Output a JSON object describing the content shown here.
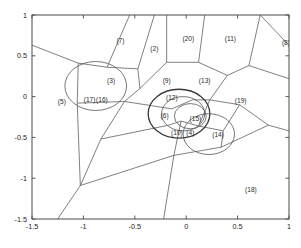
{
  "chart_data": {
    "type": "scatter",
    "title": "",
    "subtitle": "",
    "xlabel": "",
    "ylabel": "",
    "xlim": [
      -1.5,
      1.0
    ],
    "ylim": [
      -1.5,
      1.0
    ],
    "grid": false,
    "legend": "none",
    "xticks": [
      "-1.5",
      "-1",
      "-0.5",
      "0",
      "0.5",
      "1"
    ],
    "xtick_values": [
      -1.5,
      -1,
      -0.5,
      0,
      0.5,
      1
    ],
    "yticks": [
      "1",
      "0.5",
      "0",
      "-0.5",
      "-1",
      "-1.5"
    ],
    "ytick_values": [
      1,
      0.5,
      0,
      -0.5,
      -1,
      -1.5
    ],
    "annotations": [
      {
        "label": "(7)",
        "x": -0.64,
        "y": 0.66
      },
      {
        "label": "(2)",
        "x": -0.31,
        "y": 0.56
      },
      {
        "label": "(20)",
        "x": 0.02,
        "y": 0.68
      },
      {
        "label": "(11)",
        "x": 0.43,
        "y": 0.68
      },
      {
        "label": "(8)",
        "x": 0.97,
        "y": 0.63
      },
      {
        "label": "(3)",
        "x": -0.73,
        "y": 0.17
      },
      {
        "label": "(9)",
        "x": -0.19,
        "y": 0.17
      },
      {
        "label": "(13)",
        "x": 0.18,
        "y": 0.17
      },
      {
        "label": "(5)",
        "x": -1.21,
        "y": -0.09
      },
      {
        "label": "(17)",
        "x": -0.94,
        "y": -0.07
      },
      {
        "label": "(16)",
        "x": -0.82,
        "y": -0.07
      },
      {
        "label": "(12)",
        "x": -0.14,
        "y": -0.04
      },
      {
        "label": "(19)",
        "x": 0.53,
        "y": -0.08
      },
      {
        "label": "(6)",
        "x": -0.21,
        "y": -0.26
      },
      {
        "label": "(15)",
        "x": 0.09,
        "y": -0.3
      },
      {
        "label": "(10)",
        "x": -0.09,
        "y": -0.47
      },
      {
        "label": "(4)",
        "x": 0.04,
        "y": -0.47
      },
      {
        "label": "(14)",
        "x": 0.31,
        "y": -0.5
      },
      {
        "label": "(18)",
        "x": 0.63,
        "y": -1.17
      }
    ],
    "circles": [
      {
        "cx": -0.88,
        "cy": 0.13,
        "r": 0.3,
        "emphasis": "normal"
      },
      {
        "cx": -0.07,
        "cy": -0.21,
        "r": 0.3,
        "emphasis": "bold"
      },
      {
        "cx": -0.03,
        "cy": -0.21,
        "r": 0.21,
        "emphasis": "normal"
      },
      {
        "cx": 0.04,
        "cy": -0.24,
        "r": 0.155,
        "emphasis": "normal"
      },
      {
        "cx": 0.22,
        "cy": -0.46,
        "r": 0.25,
        "emphasis": "normal"
      }
    ],
    "voronoi_edges": [
      [
        [
          -1.5,
          0.63
        ],
        [
          -1.05,
          0.41
        ]
      ],
      [
        [
          -1.05,
          0.41
        ],
        [
          -0.77,
          0.36
        ]
      ],
      [
        [
          -0.77,
          0.36
        ],
        [
          -0.47,
          0.34
        ]
      ],
      [
        [
          -0.47,
          0.34
        ],
        [
          -0.45,
          0.1
        ]
      ],
      [
        [
          -0.45,
          0.1
        ],
        [
          -0.6,
          -0.06
        ]
      ],
      [
        [
          -0.6,
          -0.06
        ],
        [
          -1.06,
          -0.08
        ]
      ],
      [
        [
          -1.06,
          -0.08
        ],
        [
          -1.05,
          0.41
        ]
      ],
      [
        [
          -0.77,
          0.36
        ],
        [
          -0.55,
          1.0
        ]
      ],
      [
        [
          -0.47,
          0.34
        ],
        [
          -0.31,
          1.0
        ]
      ],
      [
        [
          -0.45,
          0.1
        ],
        [
          -0.19,
          0.42
        ]
      ],
      [
        [
          -0.19,
          0.42
        ],
        [
          -0.19,
          1.0
        ]
      ],
      [
        [
          -0.19,
          0.42
        ],
        [
          0.12,
          0.42
        ]
      ],
      [
        [
          0.12,
          0.42
        ],
        [
          0.18,
          1.0
        ]
      ],
      [
        [
          0.12,
          0.42
        ],
        [
          0.4,
          0.26
        ]
      ],
      [
        [
          0.4,
          0.26
        ],
        [
          0.61,
          0.38
        ]
      ],
      [
        [
          0.61,
          0.38
        ],
        [
          0.72,
          1.0
        ]
      ],
      [
        [
          0.61,
          0.38
        ],
        [
          1.0,
          0.22
        ]
      ],
      [
        [
          0.72,
          1.0
        ],
        [
          1.0,
          0.63
        ]
      ],
      [
        [
          0.4,
          0.26
        ],
        [
          0.23,
          -0.04
        ]
      ],
      [
        [
          0.23,
          -0.04
        ],
        [
          0.06,
          -0.04
        ]
      ],
      [
        [
          0.06,
          -0.04
        ],
        [
          -0.14,
          -0.15
        ]
      ],
      [
        [
          -0.14,
          -0.15
        ],
        [
          -0.6,
          -0.06
        ]
      ],
      [
        [
          -0.6,
          -0.06
        ],
        [
          -0.83,
          -0.52
        ]
      ],
      [
        [
          -1.06,
          -0.08
        ],
        [
          -1.03,
          -1.09
        ]
      ],
      [
        [
          -1.03,
          -1.09
        ],
        [
          -1.25,
          -1.5
        ]
      ],
      [
        [
          -1.03,
          -1.09
        ],
        [
          -0.83,
          -0.52
        ]
      ],
      [
        [
          -0.83,
          -0.52
        ],
        [
          -0.17,
          -0.35
        ]
      ],
      [
        [
          -0.17,
          -0.35
        ],
        [
          -0.05,
          -0.3
        ]
      ],
      [
        [
          -0.05,
          -0.3
        ],
        [
          0.12,
          -0.36
        ]
      ],
      [
        [
          0.12,
          -0.36
        ],
        [
          0.23,
          -0.04
        ]
      ],
      [
        [
          0.23,
          -0.04
        ],
        [
          0.52,
          -0.1
        ]
      ],
      [
        [
          0.52,
          -0.1
        ],
        [
          0.8,
          -0.35
        ]
      ],
      [
        [
          0.8,
          -0.35
        ],
        [
          1.0,
          -0.42
        ]
      ],
      [
        [
          0.52,
          -0.1
        ],
        [
          0.36,
          -0.42
        ]
      ],
      [
        [
          0.36,
          -0.42
        ],
        [
          0.12,
          -0.36
        ]
      ],
      [
        [
          0.36,
          -0.42
        ],
        [
          0.34,
          -0.62
        ]
      ],
      [
        [
          0.34,
          -0.62
        ],
        [
          0.8,
          -0.35
        ]
      ],
      [
        [
          0.34,
          -0.62
        ],
        [
          -0.12,
          -0.72
        ]
      ],
      [
        [
          -0.12,
          -0.72
        ],
        [
          -0.05,
          -0.3
        ]
      ],
      [
        [
          -0.12,
          -0.72
        ],
        [
          -0.22,
          -1.5
        ]
      ],
      [
        [
          -0.12,
          -0.72
        ],
        [
          -1.03,
          -1.09
        ]
      ]
    ]
  },
  "figure": {
    "background": "#ffffff",
    "frame_color": "#4a4a4a",
    "line_color": "#555555",
    "text_color": "#2b2b2b"
  }
}
